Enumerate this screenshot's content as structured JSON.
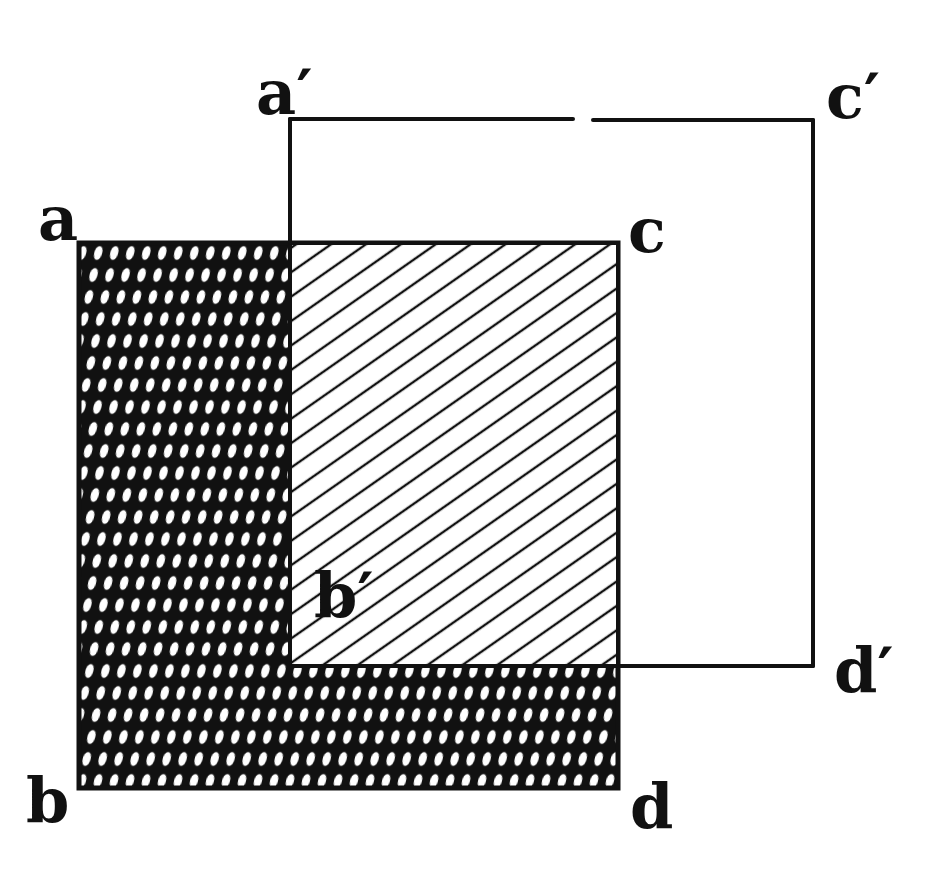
{
  "diagram": {
    "type": "overlapping-squares",
    "ink_color": "#111111",
    "background": "#ffffff",
    "square_abcd": {
      "x": 79,
      "y": 243,
      "width": 539,
      "height": 545,
      "fill": "crosshatch-dark"
    },
    "square_a_prime": {
      "x": 290,
      "y": 118,
      "width": 523,
      "height": 548,
      "fill": "none"
    },
    "overlap_region": {
      "x": 290,
      "y": 243,
      "width": 328,
      "height": 423,
      "fill": "diagonal-hatch"
    },
    "top_line_gap": {
      "x1": 573,
      "x2": 593,
      "y": 119
    }
  },
  "labels": {
    "a": "a",
    "b": "b",
    "c": "c",
    "d": "d",
    "a_prime": "a′",
    "b_prime": "b′",
    "c_prime": "c′",
    "d_prime": "d′"
  }
}
